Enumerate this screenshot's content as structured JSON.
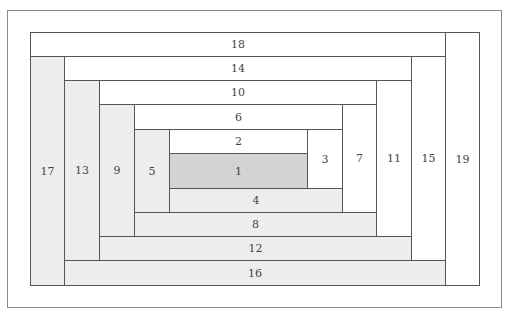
{
  "diagram": {
    "type": "log-cabin-block-layout",
    "colors": {
      "white": "#ffffff",
      "light": "#ededed",
      "center": "#d3d3d3",
      "border": "#555555"
    },
    "blocks": [
      {
        "label": "1",
        "x": 169,
        "y": 153,
        "w": 139,
        "h": 36,
        "fill": "dark"
      },
      {
        "label": "2",
        "x": 169,
        "y": 129,
        "w": 139,
        "h": 25,
        "fill": "white"
      },
      {
        "label": "3",
        "x": 307,
        "y": 129,
        "w": 36,
        "h": 60,
        "fill": "white"
      },
      {
        "label": "4",
        "x": 169,
        "y": 188,
        "w": 174,
        "h": 25,
        "fill": "light"
      },
      {
        "label": "5",
        "x": 134,
        "y": 129,
        "w": 36,
        "h": 84,
        "fill": "light"
      },
      {
        "label": "6",
        "x": 134,
        "y": 104,
        "w": 209,
        "h": 26,
        "fill": "white"
      },
      {
        "label": "7",
        "x": 342,
        "y": 104,
        "w": 35,
        "h": 109,
        "fill": "white"
      },
      {
        "label": "8",
        "x": 134,
        "y": 212,
        "w": 243,
        "h": 25,
        "fill": "light"
      },
      {
        "label": "9",
        "x": 99,
        "y": 104,
        "w": 36,
        "h": 133,
        "fill": "light"
      },
      {
        "label": "10",
        "x": 99,
        "y": 80,
        "w": 278,
        "h": 25,
        "fill": "white"
      },
      {
        "label": "11",
        "x": 376,
        "y": 80,
        "w": 36,
        "h": 157,
        "fill": "white"
      },
      {
        "label": "12",
        "x": 99,
        "y": 236,
        "w": 313,
        "h": 25,
        "fill": "light"
      },
      {
        "label": "13",
        "x": 64,
        "y": 80,
        "w": 36,
        "h": 181,
        "fill": "light"
      },
      {
        "label": "14",
        "x": 64,
        "y": 56,
        "w": 348,
        "h": 25,
        "fill": "white"
      },
      {
        "label": "15",
        "x": 411,
        "y": 56,
        "w": 35,
        "h": 205,
        "fill": "white"
      },
      {
        "label": "16",
        "x": 64,
        "y": 260,
        "w": 382,
        "h": 26,
        "fill": "light"
      },
      {
        "label": "17",
        "x": 30,
        "y": 56,
        "w": 35,
        "h": 230,
        "fill": "light"
      },
      {
        "label": "18",
        "x": 30,
        "y": 32,
        "w": 416,
        "h": 25,
        "fill": "white"
      },
      {
        "label": "19",
        "x": 445,
        "y": 32,
        "w": 35,
        "h": 254,
        "fill": "white"
      }
    ]
  }
}
